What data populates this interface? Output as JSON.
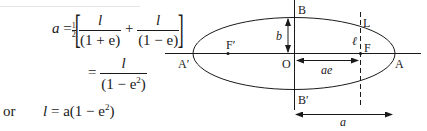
{
  "equations": {
    "line1": {
      "lhs": "a",
      "eq": "=",
      "half_num": "1",
      "half_den": "2",
      "term1_num": "l",
      "term1_den": "(1 + e)",
      "plus": "+",
      "term2_num": "l",
      "term2_den": "(1 − e)"
    },
    "line2": {
      "eq": "=",
      "num": "l",
      "den_prefix": "(1 − e",
      "den_sup": "2",
      "den_suffix": ")"
    },
    "line3": {
      "prefix": "or",
      "lhs": "l",
      "eq": "=",
      "rhs_prefix": "a(1 − e",
      "rhs_sup": "2",
      "rhs_suffix": ")"
    }
  },
  "diagram": {
    "labels": {
      "B": "B",
      "B_prime": "B′",
      "A": "A",
      "A_prime": "A′",
      "O": "O",
      "F": "F",
      "F_prime": "F′",
      "L": "L",
      "b": "b",
      "ell": "ℓ",
      "ae": "ae",
      "a": "a"
    },
    "colors": {
      "stroke": "#1a1a1a"
    }
  }
}
